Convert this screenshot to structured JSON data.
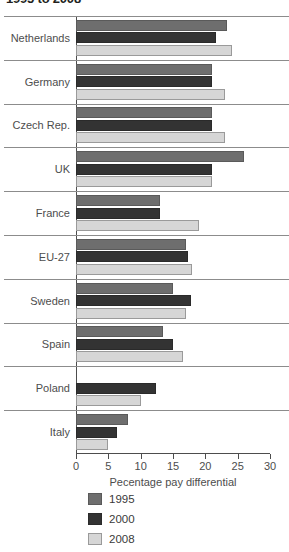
{
  "title": "1995 to 2008",
  "chart_data": {
    "type": "bar",
    "orientation": "horizontal",
    "title": "1995 to 2008",
    "xlabel": "Pecentage pay differential",
    "ylabel": "",
    "xlim": [
      0,
      30
    ],
    "xticks": [
      0,
      5,
      10,
      15,
      20,
      25,
      30
    ],
    "xtick_labels": [
      "0",
      "5",
      "10",
      "15",
      "20",
      "25",
      "30"
    ],
    "grid": false,
    "legend_position": "bottom-left",
    "categories": [
      "Netherlands",
      "Germany",
      "Czech Rep.",
      "UK",
      "France",
      "EU-27",
      "Sweden",
      "Spain",
      "Poland",
      "Italy"
    ],
    "series": [
      {
        "name": "1995",
        "color": "#6e6e6e",
        "values": [
          23.3,
          21.0,
          21.0,
          26.0,
          13.0,
          17.0,
          15.0,
          13.4,
          null,
          8.1
        ]
      },
      {
        "name": "2000",
        "color": "#333333",
        "values": [
          21.7,
          21.0,
          21.0,
          21.0,
          13.0,
          17.3,
          17.8,
          15.0,
          12.3,
          6.3
        ]
      },
      {
        "name": "2008",
        "color": "#d6d6d6",
        "values": [
          24.2,
          23.0,
          23.0,
          21.0,
          19.0,
          18.0,
          17.0,
          16.6,
          10.0,
          5.0
        ]
      }
    ]
  },
  "legend": {
    "items": [
      {
        "label": "1995",
        "color": "#6e6e6e"
      },
      {
        "label": "2000",
        "color": "#333333"
      },
      {
        "label": "2008",
        "color": "#d6d6d6"
      }
    ]
  }
}
